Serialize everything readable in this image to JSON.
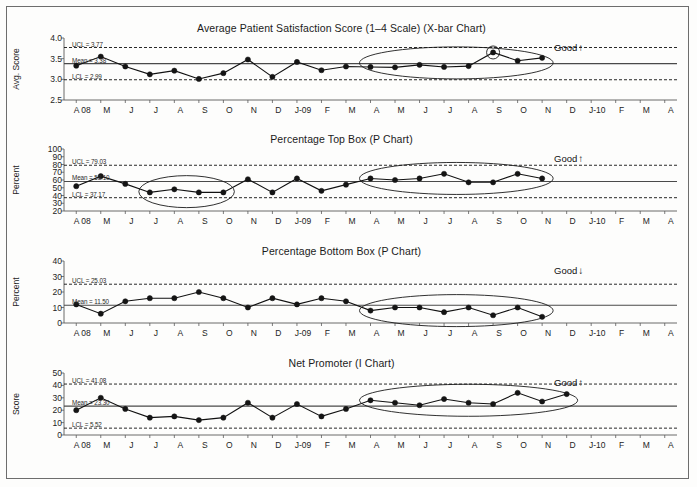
{
  "page": {
    "background_color": "#fdfdfc",
    "frame_color": "#6d6d6d"
  },
  "x_categories": [
    "A 08",
    "M",
    "J",
    "J",
    "A",
    "S",
    "O",
    "N",
    "D",
    "J-09",
    "F",
    "M",
    "A",
    "M",
    "J",
    "J",
    "A",
    "S",
    "O",
    "N",
    "D",
    "J-10",
    "F",
    "M",
    "A"
  ],
  "charts": [
    {
      "id": "avg-patient-satisfaction",
      "title": "Average Patient Satisfaction Score (1–4 Scale) (X-bar Chart)",
      "ylabel": "Avg. Score",
      "yticks": [
        "2.5",
        "3.0",
        "3.5",
        "4.0"
      ],
      "ymin": 2.5,
      "ymax": 4.0,
      "ucl": 3.77,
      "mean": 3.38,
      "lcl": 2.99,
      "ucl_label": "UCL = 3.77",
      "mean_label": "Mean = 3.38",
      "lcl_label": "LCL = 2.99",
      "good_label": "Good",
      "good_direction": "up",
      "values": [
        3.33,
        3.55,
        3.31,
        3.12,
        3.21,
        3.01,
        3.15,
        3.48,
        3.06,
        3.42,
        3.22,
        3.31,
        3.3,
        3.29,
        3.35,
        3.3,
        3.32,
        3.65,
        3.45,
        3.52,
        null,
        null,
        null,
        null,
        null
      ],
      "ellipse": {
        "from_index": 12,
        "to_index": 19
      },
      "highlight_index": 17
    },
    {
      "id": "percentage-top-box",
      "title": "Percentage Top Box (P Chart)",
      "ylabel": "Percent",
      "yticks": [
        "20",
        "30",
        "40",
        "50",
        "60",
        "70",
        "80",
        "90",
        "100"
      ],
      "ymin": 20,
      "ymax": 100,
      "ucl": 79.03,
      "mean": 58.1,
      "lcl": 37.17,
      "ucl_label": "UCL = 79.03",
      "mean_label": "Mean = 58.10",
      "lcl_label": "LCL = 37.17",
      "good_label": "Good",
      "good_direction": "up",
      "values": [
        52,
        65,
        55,
        44,
        48,
        44,
        44,
        61,
        44,
        62,
        46,
        54,
        62,
        60,
        62,
        68,
        57,
        57,
        68,
        62,
        null,
        null,
        null,
        null,
        null
      ],
      "ellipse": {
        "from_index": 12,
        "to_index": 19
      },
      "ellipse2": {
        "from_index": 3,
        "to_index": 6
      }
    },
    {
      "id": "percentage-bottom-box",
      "title": "Percentage Bottom Box (P Chart)",
      "ylabel": "Percent",
      "yticks": [
        "0",
        "10",
        "20",
        "30",
        "40"
      ],
      "ymin": 0,
      "ymax": 40,
      "ucl": 25.03,
      "mean": 11.5,
      "lcl": null,
      "ucl_label": "UCL = 25.03",
      "mean_label": "Mean = 11.50",
      "lcl_label": "",
      "good_label": "Good",
      "good_direction": "down",
      "values": [
        12,
        6,
        14,
        16,
        16,
        20,
        16,
        10,
        16,
        12,
        16,
        14,
        8,
        10,
        10,
        7,
        10,
        5,
        10,
        4,
        null,
        null,
        null,
        null,
        null
      ],
      "ellipse": {
        "from_index": 12,
        "to_index": 19
      }
    },
    {
      "id": "net-promoter",
      "title": "Net Promoter (I Chart)",
      "ylabel": "Score",
      "yticks": [
        "0",
        "10",
        "20",
        "30",
        "40",
        "50"
      ],
      "ymin": 0,
      "ymax": 50,
      "ucl": 41.08,
      "mean": 23.3,
      "lcl": 5.52,
      "ucl_label": "UCL = 41.08",
      "mean_label": "Mean = 23.30",
      "lcl_label": "LCL = 5.52",
      "good_label": "Good",
      "good_direction": "up",
      "values": [
        20,
        30,
        21,
        14,
        15,
        12,
        14,
        26,
        14,
        25,
        15,
        21,
        28,
        26,
        24,
        29,
        26,
        25,
        34,
        27,
        33,
        null,
        null,
        null,
        null
      ],
      "ellipse": {
        "from_index": 12,
        "to_index": 20
      }
    }
  ]
}
